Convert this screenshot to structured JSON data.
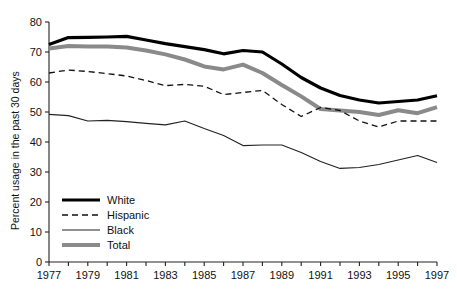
{
  "chart_data": {
    "type": "line",
    "title": "",
    "subtitle": "",
    "xlabel": "",
    "ylabel": "Percent usage in the past 30 days",
    "xlim": [
      1977,
      1997
    ],
    "ylim": [
      0,
      80
    ],
    "ytick_step": 10,
    "xtick_step": 1,
    "xtick_label_step": 2,
    "grid": false,
    "legend_position": "inside-lower-left",
    "yticks": [
      0,
      10,
      20,
      30,
      40,
      50,
      60,
      70,
      80
    ],
    "ytick_labels": [
      "0",
      "10",
      "20",
      "30",
      "40",
      "50",
      "60",
      "70",
      "80"
    ],
    "x": [
      1977,
      1978,
      1979,
      1980,
      1981,
      1982,
      1983,
      1984,
      1985,
      1986,
      1987,
      1988,
      1989,
      1990,
      1991,
      1992,
      1993,
      1994,
      1995,
      1996,
      1997
    ],
    "xtick_labels": [
      "1977",
      "",
      "1979",
      "",
      "1981",
      "",
      "1983",
      "",
      "1985",
      "",
      "1987",
      "",
      "1989",
      "",
      "1991",
      "",
      "1993",
      "",
      "1995",
      "",
      "1997"
    ],
    "xtick_labels_shown": [
      "1977",
      "1979",
      "1981",
      "1983",
      "1985",
      "1987",
      "1989",
      "1991",
      "1993",
      "1995",
      "1997"
    ],
    "series": [
      {
        "name": "White",
        "style": "solid",
        "width": 3.2,
        "color": "#000000",
        "values": [
          72.5,
          74.8,
          74.9,
          75.0,
          75.2,
          74.0,
          72.8,
          71.8,
          70.8,
          69.4,
          70.5,
          70.0,
          66.0,
          61.5,
          58.0,
          55.5,
          54.0,
          53.0,
          53.5,
          54.0,
          55.4
        ]
      },
      {
        "name": "Hispanic",
        "style": "dashed",
        "width": 1.3,
        "color": "#111111",
        "values": [
          63.0,
          64.0,
          63.5,
          62.8,
          62.0,
          60.5,
          58.8,
          59.2,
          58.6,
          55.8,
          56.5,
          57.2,
          52.5,
          48.5,
          51.5,
          50.5,
          47.0,
          45.0,
          47.0,
          47.0,
          47.0
        ]
      },
      {
        "name": "Black",
        "style": "solid",
        "width": 1.1,
        "color": "#222222",
        "values": [
          49.2,
          48.8,
          47.0,
          47.2,
          46.8,
          46.2,
          45.7,
          47.0,
          44.5,
          42.2,
          38.8,
          39.0,
          39.0,
          36.5,
          33.5,
          31.2,
          31.5,
          32.5,
          34.0,
          35.5,
          33.2
        ]
      },
      {
        "name": "Total",
        "style": "solid",
        "width": 4.0,
        "color": "#8a8a8a",
        "values": [
          71.2,
          72.0,
          71.8,
          71.8,
          71.5,
          70.5,
          69.2,
          67.5,
          65.2,
          64.2,
          65.8,
          63.0,
          59.0,
          55.2,
          51.0,
          50.5,
          50.0,
          49.0,
          50.6,
          49.6,
          51.6
        ]
      }
    ]
  },
  "legend": {
    "items": [
      {
        "label": "White"
      },
      {
        "label": "Hispanic"
      },
      {
        "label": "Black"
      },
      {
        "label": "Total"
      }
    ]
  }
}
